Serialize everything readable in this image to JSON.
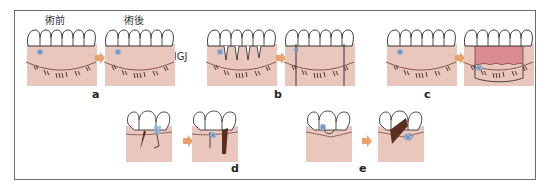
{
  "figure": {
    "header_labels": {
      "before": "術前",
      "after": "術後"
    },
    "mgj_label": "MGJ",
    "panels": [
      {
        "id": "a",
        "letter": "a"
      },
      {
        "id": "b",
        "letter": "b"
      },
      {
        "id": "c",
        "letter": "c"
      },
      {
        "id": "d",
        "letter": "d"
      },
      {
        "id": "e",
        "letter": "e"
      }
    ],
    "colors": {
      "gingiva": "#e9c7bd",
      "mucosa_line": "#7a4b3e",
      "flap_red": "#d98a93",
      "graft_brown": "#5b2e22",
      "arrow_orange": "#e8a36b",
      "defect_blue": "#8fb2de",
      "frame": "#6b6b6b"
    }
  }
}
